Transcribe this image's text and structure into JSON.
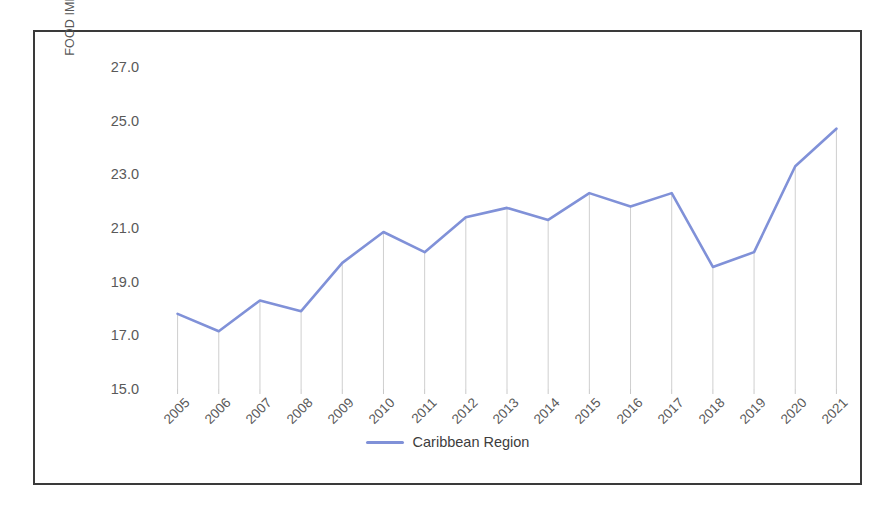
{
  "figure": {
    "border_color": "#3a3a3a"
  },
  "chart_data": {
    "type": "line",
    "title": "",
    "xlabel": "",
    "ylabel": "FOOD IMPORTS (% OF TOTAL MERCHANDISE\nIMPORTS)",
    "ylim": [
      15.0,
      27.0
    ],
    "y_ticks": [
      "15.0",
      "17.0",
      "19.0",
      "21.0",
      "23.0",
      "25.0",
      "27.0"
    ],
    "y_tick_values": [
      15.0,
      17.0,
      19.0,
      21.0,
      23.0,
      25.0,
      27.0
    ],
    "grid": false,
    "droplines": true,
    "legend_position": "bottom-center",
    "categories": [
      "2005",
      "2006",
      "2007",
      "2008",
      "2009",
      "2010",
      "2011",
      "2012",
      "2013",
      "2014",
      "2015",
      "2016",
      "2017",
      "2018",
      "2019",
      "2020",
      "2021"
    ],
    "x": [
      2005,
      2006,
      2007,
      2008,
      2009,
      2010,
      2011,
      2012,
      2013,
      2014,
      2015,
      2016,
      2017,
      2018,
      2019,
      2020,
      2021
    ],
    "series": [
      {
        "name": "Caribbean Region",
        "color": "#8091d8",
        "values": [
          17.8,
          17.15,
          18.3,
          17.9,
          19.7,
          20.85,
          20.1,
          21.4,
          21.75,
          21.3,
          22.3,
          21.8,
          22.3,
          19.55,
          20.1,
          23.3,
          24.7
        ]
      }
    ]
  },
  "legend": {
    "items": [
      {
        "label": "Caribbean Region",
        "color": "#8091d8"
      }
    ]
  }
}
